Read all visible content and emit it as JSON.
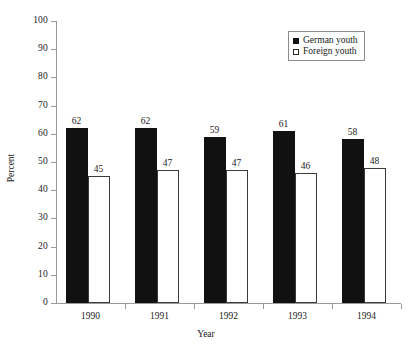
{
  "chart_data": {
    "type": "bar",
    "title": "",
    "xlabel": "Year",
    "ylabel": "Percent",
    "categories": [
      "1990",
      "1991",
      "1992",
      "1993",
      "1994"
    ],
    "series": [
      {
        "name": "German youth",
        "values": [
          62,
          62,
          59,
          61,
          58
        ],
        "color": "#111111",
        "style": "filled"
      },
      {
        "name": "Foreign youth",
        "values": [
          45,
          47,
          47,
          46,
          48
        ],
        "color": "#ffffff",
        "style": "open"
      }
    ],
    "ylim": [
      0,
      100
    ],
    "ytick_step": 10,
    "yticks": [
      0,
      10,
      20,
      30,
      40,
      50,
      60,
      70,
      80,
      90,
      100
    ],
    "ytick_labels": [
      "0",
      "10",
      "20",
      "30",
      "40",
      "50",
      "60",
      "70",
      "80",
      "90",
      "100"
    ],
    "grid": false,
    "legend_position": "top-right"
  },
  "axis": {
    "x_title": "Year",
    "y_title": "Percent"
  },
  "legend": {
    "entries": [
      {
        "label": "German youth"
      },
      {
        "label": "Foreign youth"
      }
    ]
  }
}
